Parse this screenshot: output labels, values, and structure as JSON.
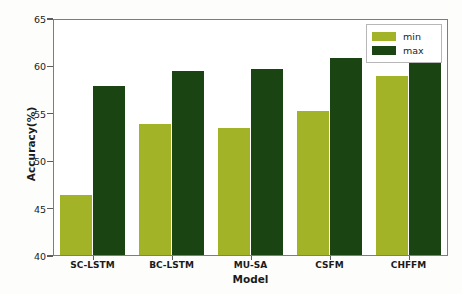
{
  "chart_data": {
    "type": "bar",
    "title": "",
    "xlabel": "Model",
    "ylabel": "Accuracy(%)",
    "categories": [
      "SC-LSTM",
      "BC-LSTM",
      "MU-SA",
      "CSFM",
      "CHFFM"
    ],
    "series": [
      {
        "name": "min",
        "color": "#a3b328",
        "values": [
          46.4,
          53.9,
          53.5,
          55.3,
          59.0
        ]
      },
      {
        "name": "max",
        "color": "#1b4413",
        "values": [
          57.9,
          59.5,
          59.7,
          60.9,
          61.2
        ]
      }
    ],
    "ylim": [
      40,
      65
    ],
    "yticks": [
      40,
      45,
      50,
      55,
      60,
      65
    ],
    "ytick_labels": [
      "40",
      "45",
      "50",
      "55",
      "60",
      "65"
    ],
    "grid": false,
    "legend_position": "top-right",
    "legend_entries": [
      "min",
      "max"
    ]
  }
}
